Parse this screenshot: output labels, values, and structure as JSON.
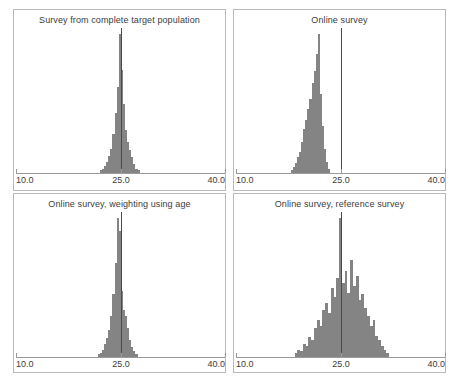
{
  "figure": {
    "width": 454,
    "height": 383,
    "background": "#ffffff",
    "bar_color": "#848484",
    "axis_color": "#9a9a9a",
    "refline_color": "#4a4a4a",
    "panel_border_color": "#b9b9b9",
    "text_color": "#3c3c3c"
  },
  "axis": {
    "xlim": [
      10.0,
      40.0
    ],
    "ticks": [
      10.0,
      25.0,
      40.0
    ],
    "tick_labels": [
      "10.0",
      "25.0",
      "40.0"
    ],
    "reference_value": 25.0
  },
  "panels": [
    {
      "id": "survey-complete-target-population",
      "title": "Survey from complete target population"
    },
    {
      "id": "online-survey",
      "title": "Online survey"
    },
    {
      "id": "online-survey-weighting-using-age",
      "title": "Online survey, weighting using age"
    },
    {
      "id": "online-survey-reference-survey",
      "title": "Online survey, reference survey"
    }
  ],
  "chart_data": [
    {
      "type": "bar",
      "title": "Survey from complete target population",
      "xlabel": "",
      "ylabel": "",
      "xlim": [
        10.0,
        40.0
      ],
      "ylim": [
        0,
        1
      ],
      "grid": false,
      "legend": "none",
      "annotations": [
        {
          "type": "vline",
          "x": 25.0,
          "label": "reference value 25.0"
        }
      ],
      "x": [
        22.2,
        22.5,
        22.8,
        23.1,
        23.4,
        23.7,
        24.0,
        24.3,
        24.6,
        24.9,
        25.2,
        25.5,
        25.8,
        26.1,
        26.4,
        26.7,
        27.0,
        27.3,
        27.6
      ],
      "values": [
        0.02,
        0.03,
        0.05,
        0.08,
        0.12,
        0.17,
        0.27,
        0.42,
        0.6,
        0.97,
        0.72,
        0.48,
        0.3,
        0.22,
        0.16,
        0.11,
        0.06,
        0.03,
        0.02
      ]
    },
    {
      "type": "bar",
      "title": "Online survey",
      "xlabel": "",
      "ylabel": "",
      "xlim": [
        10.0,
        40.0
      ],
      "ylim": [
        0,
        1
      ],
      "grid": false,
      "legend": "none",
      "annotations": [
        {
          "type": "vline",
          "x": 25.0,
          "label": "reference value 25.0"
        }
      ],
      "x": [
        18.0,
        18.3,
        18.6,
        18.9,
        19.2,
        19.5,
        19.8,
        20.1,
        20.4,
        20.7,
        21.0,
        21.3,
        21.6,
        21.9,
        22.2,
        22.5,
        22.8,
        23.1,
        23.4
      ],
      "values": [
        0.02,
        0.04,
        0.07,
        0.11,
        0.15,
        0.22,
        0.31,
        0.37,
        0.45,
        0.52,
        0.63,
        0.71,
        0.83,
        0.97,
        0.55,
        0.33,
        0.17,
        0.08,
        0.03
      ]
    },
    {
      "type": "bar",
      "title": "Online survey, weighting using age",
      "xlabel": "",
      "ylabel": "",
      "xlim": [
        10.0,
        40.0
      ],
      "ylim": [
        0,
        1
      ],
      "grid": false,
      "legend": "none",
      "annotations": [
        {
          "type": "vline",
          "x": 25.0,
          "label": "reference value 25.0"
        }
      ],
      "x": [
        21.9,
        22.2,
        22.5,
        22.8,
        23.1,
        23.4,
        23.7,
        24.0,
        24.3,
        24.6,
        24.9,
        25.2,
        25.5,
        25.8,
        26.1,
        26.4,
        26.7,
        27.0,
        27.3
      ],
      "values": [
        0.02,
        0.03,
        0.05,
        0.09,
        0.13,
        0.19,
        0.29,
        0.44,
        0.66,
        0.97,
        0.88,
        0.46,
        0.33,
        0.29,
        0.2,
        0.12,
        0.07,
        0.04,
        0.02
      ]
    },
    {
      "type": "bar",
      "title": "Online survey, reference survey",
      "xlabel": "",
      "ylabel": "",
      "xlim": [
        10.0,
        40.0
      ],
      "ylim": [
        0,
        1
      ],
      "grid": false,
      "legend": "none",
      "annotations": [
        {
          "type": "vline",
          "x": 25.0,
          "label": "reference value 25.0"
        }
      ],
      "x": [
        18.6,
        19.0,
        19.4,
        19.8,
        20.2,
        20.6,
        21.0,
        21.4,
        21.8,
        22.2,
        22.6,
        23.0,
        23.4,
        23.8,
        24.2,
        24.6,
        25.0,
        25.4,
        25.8,
        26.2,
        26.6,
        27.0,
        27.4,
        27.8,
        28.2,
        28.6,
        29.0,
        29.4,
        29.8,
        30.2,
        30.6,
        31.0,
        31.4,
        31.8
      ],
      "values": [
        0.03,
        0.05,
        0.04,
        0.09,
        0.08,
        0.14,
        0.12,
        0.2,
        0.26,
        0.22,
        0.33,
        0.38,
        0.31,
        0.48,
        0.42,
        0.55,
        0.97,
        0.52,
        0.6,
        0.45,
        0.68,
        0.5,
        0.57,
        0.4,
        0.44,
        0.34,
        0.29,
        0.22,
        0.26,
        0.15,
        0.12,
        0.08,
        0.05,
        0.03
      ]
    }
  ]
}
